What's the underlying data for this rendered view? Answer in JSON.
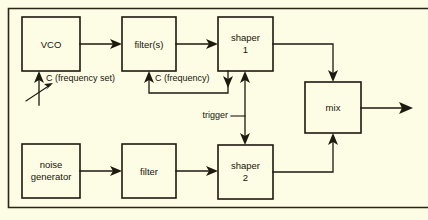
{
  "diagram": {
    "background_color": "#fdfce4",
    "line_color": "#1d1a0f",
    "frame": {
      "label": "diagram-border"
    },
    "blocks": [
      {
        "id": "vco",
        "line1": "VCO",
        "line2": "",
        "x": 22,
        "y": 17,
        "w": 58,
        "h": 54
      },
      {
        "id": "filters",
        "line1": "filter(s)",
        "line2": "",
        "x": 122,
        "y": 17,
        "w": 54,
        "h": 54
      },
      {
        "id": "shaper1",
        "line1": "shaper",
        "line2": "1",
        "x": 218,
        "y": 17,
        "w": 55,
        "h": 54
      },
      {
        "id": "mix",
        "line1": "mix",
        "line2": "",
        "x": 305,
        "y": 82,
        "w": 56,
        "h": 51
      },
      {
        "id": "noise_generator",
        "line1": "noise",
        "line2": "generator",
        "x": 22,
        "y": 144,
        "w": 58,
        "h": 54
      },
      {
        "id": "filter",
        "line1": "filter",
        "line2": "",
        "x": 122,
        "y": 144,
        "w": 54,
        "h": 54
      },
      {
        "id": "shaper2",
        "line1": "shaper",
        "line2": "2",
        "x": 218,
        "y": 145,
        "w": 55,
        "h": 54
      }
    ],
    "annotations": [
      {
        "id": "c_frequency_set",
        "text": "C (frequency set)",
        "x": 48,
        "y": 79
      },
      {
        "id": "c_frequency",
        "text": "C (frequency)",
        "x": 152,
        "y": 79
      },
      {
        "id": "trigger",
        "text": "trigger",
        "x": 200,
        "y": 116
      }
    ],
    "signal_paths": [
      {
        "id": "vco-to-filters",
        "from": "vco",
        "to": "filters"
      },
      {
        "id": "filters-to-shaper1",
        "from": "filters",
        "to": "shaper1"
      },
      {
        "id": "shaper1-to-mix",
        "from": "shaper1",
        "to": "mix"
      },
      {
        "id": "shaper1-to-filters",
        "from": "shaper1",
        "to": "filters"
      },
      {
        "id": "trigger-link",
        "from": "shaper1",
        "to": "shaper2"
      },
      {
        "id": "noise-to-filter",
        "from": "noise_generator",
        "to": "filter"
      },
      {
        "id": "filter-to-shaper2",
        "from": "filter",
        "to": "shaper2"
      },
      {
        "id": "shaper2-to-mix",
        "from": "shaper2",
        "to": "mix"
      },
      {
        "id": "mix-output",
        "from": "mix",
        "to": "output"
      },
      {
        "id": "frequency-set-control",
        "from": "control",
        "to": "vco"
      }
    ]
  }
}
